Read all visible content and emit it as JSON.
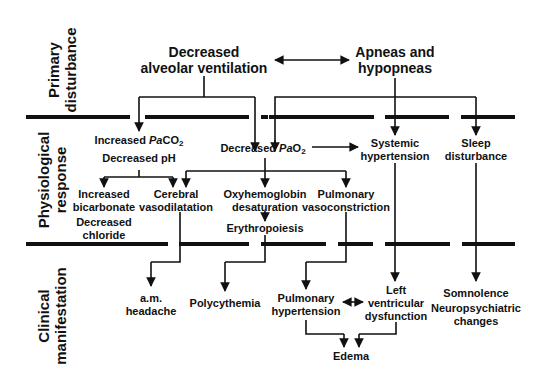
{
  "sections": {
    "primary": [
      "Primary",
      "disturbance"
    ],
    "physiological": [
      "Physiological",
      "response"
    ],
    "clinical": [
      "Clinical",
      "manifestation"
    ]
  },
  "primary": {
    "decreased_ventilation": [
      "Decreased",
      "alveolar ventilation"
    ],
    "apneas": [
      "Apneas and",
      "hypopneas"
    ]
  },
  "physiological": {
    "paco2": {
      "line1_prefix": "Increased ",
      "line1_var": "Pa",
      "line1_gas": "CO",
      "line1_sub": "2",
      "line2": "Decreased pH"
    },
    "pao2": {
      "prefix": "Decreased ",
      "var": "Pa",
      "gas": "O",
      "sub": "2"
    },
    "systemic_hypertension": [
      "Systemic",
      "hypertension"
    ],
    "sleep_disturbance": [
      "Sleep",
      "disturbance"
    ],
    "bicarbonate": [
      "Increased",
      "bicarbonate",
      "Decreased",
      "chloride"
    ],
    "cerebral": [
      "Cerebral",
      "vasodilatation"
    ],
    "oxyhemoglobin": [
      "Oxyhemoglobin",
      "desaturation"
    ],
    "pulmonary_vaso": [
      "Pulmonary",
      "vasoconstriction"
    ],
    "erythropoiesis": "Erythropoiesis"
  },
  "clinical": {
    "headache": [
      "a.m.",
      "headache"
    ],
    "polycythemia": "Polycythemia",
    "pulmonary_hypertension": [
      "Pulmonary",
      "hypertension"
    ],
    "lv_dysfunction": [
      "Left",
      "ventricular",
      "dysfunction"
    ],
    "somnolence": [
      "Somnolence",
      "Neuropsychiatric",
      "changes"
    ],
    "edema": "Edema"
  },
  "colors": {
    "line": "#111111",
    "background": "#ffffff"
  }
}
